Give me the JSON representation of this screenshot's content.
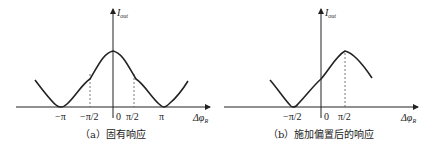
{
  "panels": [
    {
      "id": "a",
      "caption": "（a）固有响应",
      "y_axis_label": "I",
      "y_axis_sub": "out",
      "x_axis_label": "Δφ",
      "x_axis_sub": "R",
      "ticks": [
        "−π",
        "−π/2",
        "0",
        "π/2",
        "π"
      ],
      "curve": "cos-shaped: 1 + cos(Δφ_R), maximum at 0, minima at ±π",
      "dashed_guides_at": [
        "−π/2",
        "π/2"
      ]
    },
    {
      "id": "b",
      "caption": "（b）施加偏置后的响应",
      "y_axis_label": "I",
      "y_axis_sub": "out",
      "x_axis_label": "Δφ",
      "x_axis_sub": "R",
      "ticks": [
        "−π/2",
        "0",
        "π/2"
      ],
      "curve": "sin-shaped: 1 + sin(Δφ_R), maximum at π/2, minimum at −π/2",
      "dashed_guides_at": [
        "π/2"
      ]
    }
  ],
  "colors": {
    "line": "#222222",
    "dash": "#555555",
    "background": "#ffffff"
  }
}
